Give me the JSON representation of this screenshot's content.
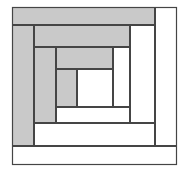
{
  "figure": {
    "canvas": {
      "width": 184,
      "height": 175,
      "background": "#ffffff"
    },
    "colors": {
      "shaded": "#c9c9c9",
      "unshaded": "#ffffff",
      "outline": "#454545"
    },
    "pieces": [
      {
        "name": "ring1-left-log",
        "x": 12,
        "y": 25,
        "w": 22,
        "h": 121,
        "fill": "shaded"
      },
      {
        "name": "ring1-top-log",
        "x": 12,
        "y": 7,
        "w": 143,
        "h": 18,
        "fill": "shaded"
      },
      {
        "name": "ring1-right-log",
        "x": 155,
        "y": 7,
        "w": 22,
        "h": 139,
        "fill": "unshaded"
      },
      {
        "name": "ring1-bottom-log",
        "x": 12,
        "y": 146,
        "w": 165,
        "h": 19,
        "fill": "unshaded"
      },
      {
        "name": "ring2-left-log",
        "x": 34,
        "y": 47,
        "w": 22,
        "h": 76,
        "fill": "shaded"
      },
      {
        "name": "ring2-top-log",
        "x": 34,
        "y": 25,
        "w": 96,
        "h": 22,
        "fill": "shaded"
      },
      {
        "name": "ring2-right-log",
        "x": 130,
        "y": 25,
        "w": 25,
        "h": 98,
        "fill": "unshaded"
      },
      {
        "name": "ring2-bottom-log",
        "x": 34,
        "y": 123,
        "w": 121,
        "h": 23,
        "fill": "unshaded"
      },
      {
        "name": "ring3-left-log",
        "x": 56,
        "y": 69,
        "w": 21,
        "h": 38,
        "fill": "shaded"
      },
      {
        "name": "ring3-top-log",
        "x": 56,
        "y": 47,
        "w": 57,
        "h": 22,
        "fill": "shaded"
      },
      {
        "name": "ring3-right-log",
        "x": 113,
        "y": 47,
        "w": 17,
        "h": 60,
        "fill": "unshaded"
      },
      {
        "name": "ring3-bottom-log",
        "x": 56,
        "y": 107,
        "w": 74,
        "h": 16,
        "fill": "unshaded"
      },
      {
        "name": "center-square",
        "x": 77,
        "y": 69,
        "w": 36,
        "h": 38,
        "fill": "unshaded"
      }
    ],
    "outer_border": {
      "x": 12,
      "y": 7,
      "w": 165,
      "h": 158
    }
  }
}
